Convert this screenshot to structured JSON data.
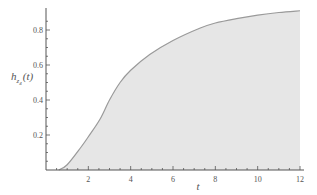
{
  "chart_data": {
    "type": "area",
    "title": "",
    "xlabel": "t",
    "ylabel": "h_{z_4}(t)",
    "ylabel_parts": {
      "base": "h",
      "sub": "z",
      "subsub": "4",
      "arg": "(t)"
    },
    "xlim": [
      0,
      12
    ],
    "ylim": [
      0,
      0.92
    ],
    "x_ticks": [
      2,
      4,
      6,
      8,
      10,
      12
    ],
    "x_tick_labels": [
      "2",
      "4",
      "6",
      "8",
      "10",
      "12"
    ],
    "y_ticks": [
      0.2,
      0.4,
      0.6,
      0.8
    ],
    "y_tick_labels": [
      "0.2",
      "0.4",
      "0.6",
      "0.8"
    ],
    "grid": false,
    "legend": null,
    "series": [
      {
        "name": "h_z4(t)",
        "x": [
          0.6,
          1.0,
          1.65,
          2.0,
          2.55,
          3.0,
          3.5,
          4.0,
          4.9,
          6.0,
          7.26,
          8.0,
          9.0,
          10.0,
          11.0,
          12.0
        ],
        "values": [
          0.0,
          0.03,
          0.13,
          0.19,
          0.29,
          0.4,
          0.5,
          0.57,
          0.66,
          0.74,
          0.81,
          0.84,
          0.865,
          0.885,
          0.9,
          0.91
        ]
      }
    ],
    "colors": {
      "fill": "#e6e6e6",
      "stroke": "#9a9a9a",
      "axis": "#555555"
    }
  }
}
